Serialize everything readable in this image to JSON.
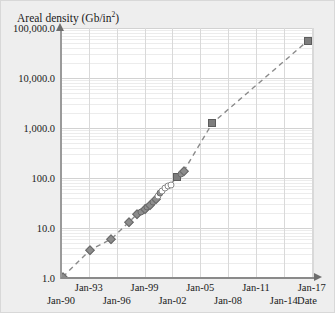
{
  "chart_data": {
    "type": "scatter",
    "title": "",
    "ylabel": "Areal density (Gb/in",
    "ylabel_sup": "2",
    "ylabel_tail": ")",
    "xlabel": "Date",
    "yscale": "log",
    "ylim": [
      1.0,
      100000.0
    ],
    "xlim": [
      "Jan-90",
      "Jan-17"
    ],
    "grid": true,
    "legend": "none",
    "ytick_labels": [
      "100,000.0",
      "10,000.0",
      "1,000.0",
      "100.0",
      "10.0",
      "1.0"
    ],
    "ytick_values": [
      100000.0,
      10000.0,
      1000.0,
      100.0,
      10.0,
      1.0
    ],
    "xtick_labels_upper": [
      "Jan-93",
      "Jan-99",
      "Jan-05",
      "Jan-11",
      "Jan-17"
    ],
    "xtick_labels_lower": [
      "Jan-90",
      "Jan-96",
      "Jan-02",
      "Jan-08",
      "Jan-14"
    ],
    "xtick_values_upper": [
      1993.0,
      1999.0,
      2005.0,
      2011.0,
      2017.0
    ],
    "xtick_values_lower": [
      1990.0,
      1996.0,
      2002.0,
      2008.0,
      2014.0
    ],
    "series": [
      {
        "name": "Areal density",
        "marker": "mixed",
        "points": [
          {
            "x": 1990.2,
            "y": 1.05,
            "marker": "diamond"
          },
          {
            "x": 1993.1,
            "y": 3.6,
            "marker": "diamond"
          },
          {
            "x": 1995.4,
            "y": 6.0,
            "marker": "diamond"
          },
          {
            "x": 1997.3,
            "y": 13.0,
            "marker": "diamond"
          },
          {
            "x": 1998.2,
            "y": 19.0,
            "marker": "diamond"
          },
          {
            "x": 1998.6,
            "y": 21.0,
            "marker": "circle-filled"
          },
          {
            "x": 1999.0,
            "y": 23.5,
            "marker": "diamond"
          },
          {
            "x": 1999.3,
            "y": 26.0,
            "marker": "circle-filled"
          },
          {
            "x": 1999.6,
            "y": 29.0,
            "marker": "diamond"
          },
          {
            "x": 1999.9,
            "y": 33.0,
            "marker": "circle-filled"
          },
          {
            "x": 2000.2,
            "y": 38.0,
            "marker": "diamond"
          },
          {
            "x": 2000.4,
            "y": 43.0,
            "marker": "circle-open"
          },
          {
            "x": 2000.7,
            "y": 50.0,
            "marker": "circle-filled"
          },
          {
            "x": 2000.9,
            "y": 56.0,
            "marker": "circle-open"
          },
          {
            "x": 2001.2,
            "y": 62.0,
            "marker": "circle-open"
          },
          {
            "x": 2001.5,
            "y": 68.0,
            "marker": "circle-open"
          },
          {
            "x": 2001.8,
            "y": 74.0,
            "marker": "circle-open"
          },
          {
            "x": 2002.5,
            "y": 105.0,
            "marker": "square"
          },
          {
            "x": 2002.9,
            "y": 120.0,
            "marker": "circle-filled"
          },
          {
            "x": 2003.2,
            "y": 135.0,
            "marker": "diamond"
          },
          {
            "x": 2006.3,
            "y": 1250.0,
            "marker": "square"
          },
          {
            "x": 2016.6,
            "y": 56000.0,
            "marker": "square"
          }
        ]
      }
    ],
    "trendline": {
      "style": "dashed",
      "color": "#8a8a8a",
      "from": {
        "x": 1990.2,
        "y": 1.05
      },
      "to": {
        "x": 2016.6,
        "y": 56000.0
      }
    }
  }
}
